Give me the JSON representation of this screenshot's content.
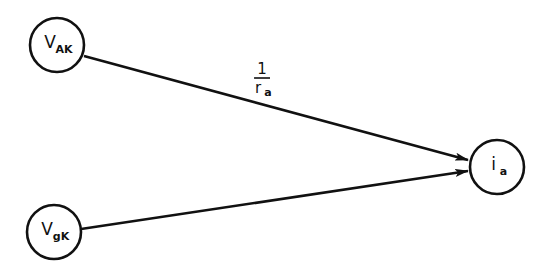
{
  "diagram": {
    "type": "signal-flow-graph",
    "colors": {
      "stroke": "#111111",
      "background": "#ffffff"
    },
    "nodes": [
      {
        "id": "vak",
        "label": "V",
        "subscript": "AK",
        "cx": 57,
        "cy": 45,
        "r": 27
      },
      {
        "id": "vgk",
        "label": "V",
        "subscript": "gK",
        "cx": 54,
        "cy": 232,
        "r": 27
      },
      {
        "id": "ia",
        "label": "i",
        "subscript": "a",
        "cx": 497,
        "cy": 167,
        "r": 27
      }
    ],
    "edges": [
      {
        "from": "vak",
        "to": "ia",
        "x1": 84,
        "y1": 56,
        "x2": 468,
        "y2": 160,
        "gain": {
          "numerator": "1",
          "denominator": "r",
          "denominator_subscript": "a"
        }
      },
      {
        "from": "vgk",
        "to": "ia",
        "x1": 81,
        "y1": 229,
        "x2": 468,
        "y2": 171,
        "gain": null
      }
    ]
  }
}
